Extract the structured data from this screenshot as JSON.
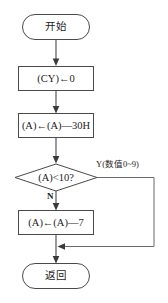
{
  "diagram": {
    "background_color": "#ffffff",
    "line_color": "#4a4a4a",
    "text_color": "#1c1c1c",
    "nodes": [
      {
        "id": "start",
        "shape": "terminator",
        "label": "开始"
      },
      {
        "id": "clear_cy",
        "shape": "process",
        "label": "(CY)←0"
      },
      {
        "id": "sub30h",
        "shape": "process",
        "label": "(A)←(A)—30H"
      },
      {
        "id": "compare",
        "shape": "decision",
        "label": "(A)<10?"
      },
      {
        "id": "sub7",
        "shape": "process",
        "label": "(A)←(A)—7"
      },
      {
        "id": "return",
        "shape": "terminator",
        "label": "返回"
      }
    ],
    "branches": {
      "no_label": "N",
      "yes_label": "Y(数值0~9)"
    }
  }
}
